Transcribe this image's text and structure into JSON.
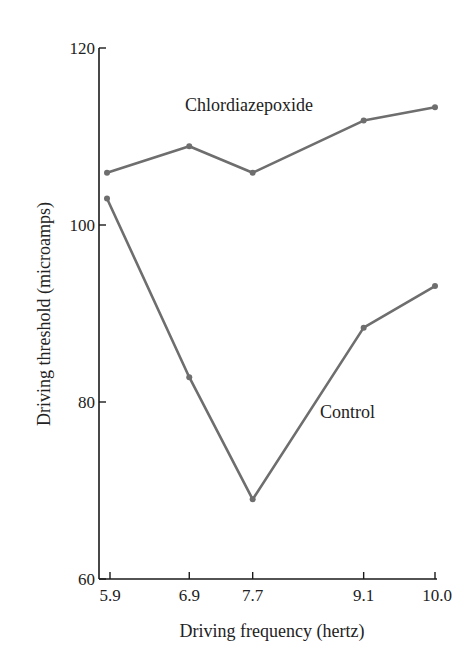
{
  "chart_data": {
    "type": "line",
    "title": "",
    "xlabel": "Driving frequency (hertz)",
    "ylabel": "Driving threshold (microamps)",
    "x": [
      5.9,
      6.9,
      7.7,
      9.1,
      10.0
    ],
    "x_tick_labels": [
      "5.9",
      "6.9",
      "7.7",
      "9.1",
      "10.0"
    ],
    "y_ticks": [
      60,
      80,
      100,
      120
    ],
    "y_tick_labels": [
      "60",
      "80",
      "100",
      "120"
    ],
    "ylim": [
      60,
      120
    ],
    "grid": false,
    "legend": "inline labels",
    "series": [
      {
        "name": "Chlordiazepoxide",
        "values": [
          105.9,
          108.9,
          105.9,
          111.8,
          113.3
        ],
        "color": "#6e6e6e"
      },
      {
        "name": "Control",
        "values": [
          103.0,
          82.8,
          69.0,
          88.4,
          93.1
        ],
        "color": "#6e6e6e"
      }
    ]
  },
  "colors": {
    "axis": "#1a1a1a",
    "line": "#6e6e6e",
    "text": "#222222"
  }
}
